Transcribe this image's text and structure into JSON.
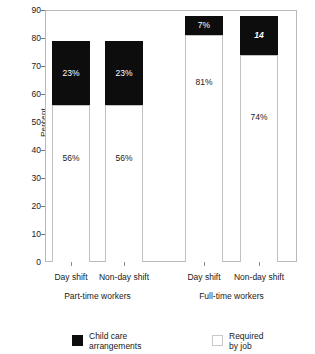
{
  "chart_data": {
    "type": "bar",
    "title": "",
    "subtitle": "",
    "xlabel": "",
    "ylabel": "Percent",
    "ylim": [
      0,
      90
    ],
    "ytick_values": [
      0,
      10,
      20,
      30,
      40,
      50,
      60,
      70,
      80,
      90
    ],
    "ytick_labels": [
      "0",
      "10",
      "20",
      "30",
      "40",
      "50",
      "60",
      "70",
      "80",
      "90"
    ],
    "grid": false,
    "stacked": true,
    "legend_position": "bottom",
    "categories": [
      "Day shift",
      "Non-day shift",
      "Day shift",
      "Non-day shift"
    ],
    "groups": [
      {
        "name": "Part-time workers",
        "categories": [
          "Day shift",
          "Non-day shift"
        ]
      },
      {
        "name": "Full-time workers",
        "categories": [
          "Day shift",
          "Non-day shift"
        ]
      }
    ],
    "series": [
      {
        "name": "Required by job",
        "color": "#ffffff",
        "values": [
          56,
          56,
          81,
          74
        ],
        "labels": [
          "56%",
          "56%",
          "81%",
          "74%"
        ]
      },
      {
        "name": "Child care arrangements",
        "color": "#0d0d0d",
        "values": [
          23,
          23,
          7,
          14
        ],
        "labels": [
          "23%",
          "23%",
          "7%",
          "14"
        ]
      }
    ],
    "bar_totals": [
      79,
      79,
      88,
      88
    ],
    "annotations": []
  },
  "axis": {
    "y_title": "Percent"
  },
  "legend": {
    "items": [
      {
        "label": "Child care\narrangements",
        "swatch": "black"
      },
      {
        "label": "Required\nby job",
        "swatch": "white"
      }
    ]
  }
}
